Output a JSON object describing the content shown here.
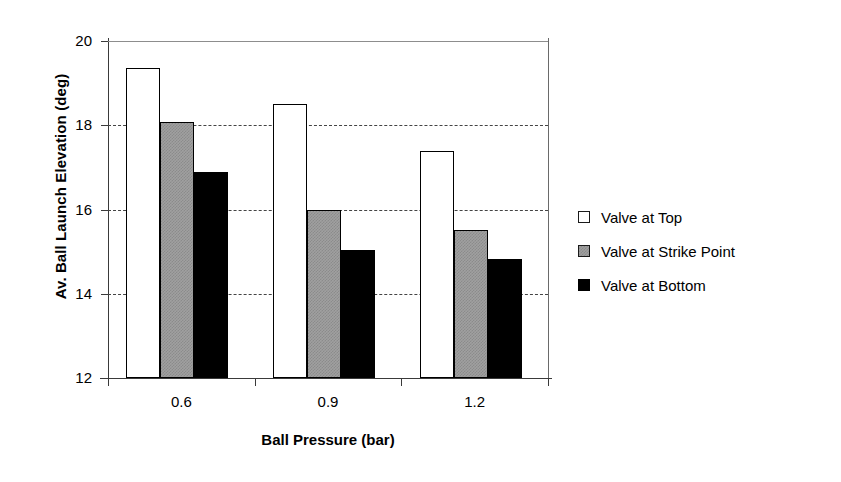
{
  "chart_data": {
    "type": "bar",
    "title": "",
    "xlabel": "Ball Pressure (bar)",
    "ylabel": "Av. Ball Launch Elevation (deg)",
    "categories": [
      "0.6",
      "0.9",
      "1.2"
    ],
    "series": [
      {
        "name": "Valve at Top",
        "values": [
          19.35,
          18.5,
          17.4
        ],
        "color": "#ffffff",
        "swatch": "white"
      },
      {
        "name": "Valve at Strike Point",
        "values": [
          18.08,
          16.0,
          15.52
        ],
        "color": "#a0a0a0",
        "swatch": "grey"
      },
      {
        "name": "Valve at Bottom",
        "values": [
          16.89,
          15.05,
          14.82
        ],
        "color": "#000000",
        "swatch": "black"
      }
    ],
    "ylim": [
      12,
      20
    ],
    "yticks": [
      "12",
      "14",
      "16",
      "18",
      "20"
    ],
    "ytick_values": [
      12,
      14,
      16,
      18,
      20
    ],
    "gridlines_at": [
      14,
      16,
      18
    ],
    "grid": true,
    "legend_position": "right",
    "axis_color": "#3a3a3a",
    "grid_color": "#444444"
  },
  "legend": {
    "entries": [
      {
        "label": "Valve at Top"
      },
      {
        "label": "Valve at Strike Point"
      },
      {
        "label": "Valve at Bottom"
      }
    ]
  }
}
